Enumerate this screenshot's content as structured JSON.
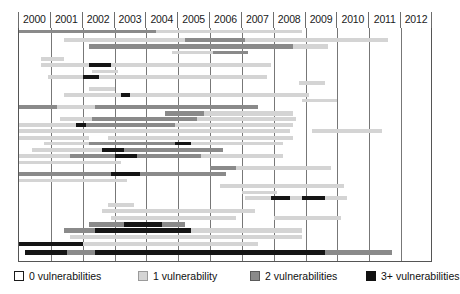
{
  "chart_data": {
    "type": "bar",
    "title": "",
    "subtitle": "",
    "xlabel": "",
    "ylabel": "",
    "orientation": "horizontal",
    "grid": true,
    "legend_position": "bottom",
    "xlim": [
      2000,
      2013
    ],
    "axis": {
      "tick_labels": [
        "2000",
        "2001",
        "2002",
        "2003",
        "2004",
        "2005",
        "2006",
        "2007",
        "2008",
        "2009",
        "2010",
        "2011",
        "2012"
      ],
      "year_start": 2000,
      "year_end": 2013,
      "column_count": 13
    },
    "categories": [
      "row-1",
      "row-2",
      "row-3",
      "row-4",
      "row-5",
      "row-6",
      "row-7",
      "row-8",
      "row-9",
      "row-10",
      "row-11",
      "row-12",
      "row-13",
      "row-14",
      "row-15",
      "row-16",
      "row-17",
      "row-18",
      "row-19",
      "row-20",
      "row-21",
      "row-22",
      "row-23",
      "row-24",
      "row-25",
      "row-26",
      "row-27",
      "row-28",
      "row-29",
      "row-30",
      "row-31",
      "row-32",
      "row-33",
      "row-34",
      "row-35",
      "row-36"
    ],
    "series": [
      {
        "name": "0 vulnerabilities",
        "level": 0,
        "color": "#ffffff"
      },
      {
        "name": "1 vulnerability",
        "level": 1,
        "color": "#d4d4d4"
      },
      {
        "name": "2 vulnerabilities",
        "level": 2,
        "color": "#8a8a8a"
      },
      {
        "name": "3+ vulnerabilities",
        "level": 3,
        "color": "#151515"
      }
    ],
    "rows": [
      {
        "y": 1.5,
        "h": 3.2,
        "segments": [
          {
            "x0": 2000.0,
            "x1": 2004.3,
            "level": 2
          },
          {
            "x0": 2004.3,
            "x1": 2008.9,
            "level": 1
          }
        ]
      },
      {
        "y": 10.0,
        "h": 4.0,
        "segments": [
          {
            "x0": 2001.4,
            "x1": 2005.2,
            "level": 1
          },
          {
            "x0": 2005.2,
            "x1": 2007.1,
            "level": 2
          },
          {
            "x0": 2007.1,
            "x1": 2011.6,
            "level": 1
          }
        ]
      },
      {
        "y": 16.0,
        "h": 4.5,
        "segments": [
          {
            "x0": 2002.2,
            "x1": 2008.6,
            "level": 2
          },
          {
            "x0": 2008.6,
            "x1": 2009.7,
            "level": 1
          }
        ]
      },
      {
        "y": 22.5,
        "h": 3.6,
        "segments": [
          {
            "x0": 2004.8,
            "x1": 2006.1,
            "level": 1
          },
          {
            "x0": 2006.1,
            "x1": 2007.2,
            "level": 2
          }
        ]
      },
      {
        "y": 29.0,
        "h": 3.8,
        "segments": [
          {
            "x0": 2000.7,
            "x1": 2001.4,
            "level": 1
          }
        ]
      },
      {
        "y": 35.0,
        "h": 4.4,
        "segments": [
          {
            "x0": 2000.7,
            "x1": 2002.2,
            "level": 1
          },
          {
            "x0": 2002.2,
            "x1": 2002.9,
            "level": 3
          },
          {
            "x0": 2002.9,
            "x1": 2007.9,
            "level": 1
          }
        ]
      },
      {
        "y": 41.5,
        "h": 3.4,
        "segments": [
          {
            "x0": 2002.3,
            "x1": 2003.1,
            "level": 1
          }
        ]
      },
      {
        "y": 47.0,
        "h": 4.2,
        "segments": [
          {
            "x0": 2000.9,
            "x1": 2002.0,
            "level": 1
          },
          {
            "x0": 2002.0,
            "x1": 2002.5,
            "level": 3
          },
          {
            "x0": 2002.5,
            "x1": 2007.8,
            "level": 1
          }
        ]
      },
      {
        "y": 53.0,
        "h": 3.6,
        "segments": [
          {
            "x0": 2008.8,
            "x1": 2009.6,
            "level": 1
          }
        ]
      },
      {
        "y": 58.5,
        "h": 4.6,
        "segments": [
          {
            "x0": 2002.2,
            "x1": 2003.0,
            "level": 1
          }
        ]
      },
      {
        "y": 65.0,
        "h": 3.8,
        "segments": [
          {
            "x0": 2001.4,
            "x1": 2003.2,
            "level": 1
          },
          {
            "x0": 2003.2,
            "x1": 2003.5,
            "level": 3
          },
          {
            "x0": 2003.5,
            "x1": 2009.1,
            "level": 1
          }
        ]
      },
      {
        "y": 71.0,
        "h": 3.4,
        "segments": [
          {
            "x0": 2008.9,
            "x1": 2010.0,
            "level": 1
          }
        ]
      },
      {
        "y": 76.5,
        "h": 4.4,
        "segments": [
          {
            "x0": 2000.0,
            "x1": 2001.2,
            "level": 2
          },
          {
            "x0": 2001.2,
            "x1": 2002.4,
            "level": 1
          },
          {
            "x0": 2002.4,
            "x1": 2007.5,
            "level": 2
          }
        ]
      },
      {
        "y": 83.0,
        "h": 4.6,
        "segments": [
          {
            "x0": 2004.6,
            "x1": 2005.8,
            "level": 2
          },
          {
            "x0": 2005.8,
            "x1": 2008.6,
            "level": 1
          }
        ]
      },
      {
        "y": 89.0,
        "h": 4.0,
        "segments": [
          {
            "x0": 2001.3,
            "x1": 2002.3,
            "level": 1
          },
          {
            "x0": 2002.3,
            "x1": 2005.6,
            "level": 2
          },
          {
            "x0": 2005.6,
            "x1": 2008.7,
            "level": 1
          }
        ]
      },
      {
        "y": 95.0,
        "h": 4.2,
        "segments": [
          {
            "x0": 2000.0,
            "x1": 2001.8,
            "level": 1
          },
          {
            "x0": 2001.8,
            "x1": 2002.1,
            "level": 3
          },
          {
            "x0": 2002.1,
            "x1": 2004.9,
            "level": 2
          },
          {
            "x0": 2004.9,
            "x1": 2008.6,
            "level": 1
          }
        ]
      },
      {
        "y": 101.0,
        "h": 4.4,
        "segments": [
          {
            "x0": 2000.0,
            "x1": 2001.5,
            "level": 1
          },
          {
            "x0": 2001.5,
            "x1": 2008.5,
            "level": 1
          },
          {
            "x0": 2009.2,
            "x1": 2011.4,
            "level": 1
          }
        ]
      },
      {
        "y": 107.5,
        "h": 4.0,
        "segments": [
          {
            "x0": 2000.0,
            "x1": 2002.2,
            "level": 1
          },
          {
            "x0": 2002.8,
            "x1": 2003.4,
            "level": 1
          },
          {
            "x0": 2003.4,
            "x1": 2008.6,
            "level": 1
          }
        ]
      },
      {
        "y": 113.5,
        "h": 3.6,
        "segments": [
          {
            "x0": 2000.8,
            "x1": 2002.2,
            "level": 1
          },
          {
            "x0": 2002.2,
            "x1": 2004.9,
            "level": 2
          },
          {
            "x0": 2004.9,
            "x1": 2005.4,
            "level": 3
          },
          {
            "x0": 2005.4,
            "x1": 2008.3,
            "level": 1
          }
        ]
      },
      {
        "y": 119.5,
        "h": 4.4,
        "segments": [
          {
            "x0": 2000.4,
            "x1": 2002.6,
            "level": 1
          },
          {
            "x0": 2002.6,
            "x1": 2003.3,
            "level": 3
          },
          {
            "x0": 2003.3,
            "x1": 2006.4,
            "level": 2
          }
        ]
      },
      {
        "y": 126.0,
        "h": 4.2,
        "segments": [
          {
            "x0": 2000.0,
            "x1": 2001.6,
            "level": 1
          },
          {
            "x0": 2001.6,
            "x1": 2003.0,
            "level": 2
          },
          {
            "x0": 2003.0,
            "x1": 2003.7,
            "level": 3
          },
          {
            "x0": 2003.7,
            "x1": 2005.7,
            "level": 2
          },
          {
            "x0": 2005.7,
            "x1": 2008.3,
            "level": 1
          }
        ]
      },
      {
        "y": 132.5,
        "h": 3.8,
        "segments": [
          {
            "x0": 2000.0,
            "x1": 2002.3,
            "level": 1
          },
          {
            "x0": 2002.3,
            "x1": 2003.2,
            "level": 1
          }
        ]
      },
      {
        "y": 138.0,
        "h": 4.0,
        "segments": [
          {
            "x0": 2006.0,
            "x1": 2006.8,
            "level": 2
          },
          {
            "x0": 2006.8,
            "x1": 2009.8,
            "level": 1
          }
        ]
      },
      {
        "y": 144.0,
        "h": 4.4,
        "segments": [
          {
            "x0": 2000.0,
            "x1": 2002.9,
            "level": 2
          },
          {
            "x0": 2002.9,
            "x1": 2003.8,
            "level": 3
          },
          {
            "x0": 2003.8,
            "x1": 2006.5,
            "level": 2
          }
        ]
      },
      {
        "y": 150.5,
        "h": 3.6,
        "segments": [
          {
            "x0": 2000.0,
            "x1": 2002.9,
            "level": 1
          },
          {
            "x0": 2002.9,
            "x1": 2003.4,
            "level": 1
          }
        ]
      },
      {
        "y": 156.0,
        "h": 4.2,
        "segments": [
          {
            "x0": 2006.3,
            "x1": 2007.5,
            "level": 1
          },
          {
            "x0": 2007.5,
            "x1": 2010.2,
            "level": 1
          }
        ]
      },
      {
        "y": 162.5,
        "h": 3.8,
        "segments": [
          {
            "x0": 2007.0,
            "x1": 2008.1,
            "level": 1
          }
        ]
      },
      {
        "y": 168.0,
        "h": 4.0,
        "segments": [
          {
            "x0": 2007.1,
            "x1": 2007.9,
            "level": 1
          },
          {
            "x0": 2007.9,
            "x1": 2008.5,
            "level": 3
          },
          {
            "x0": 2008.5,
            "x1": 2008.9,
            "level": 1
          },
          {
            "x0": 2008.9,
            "x1": 2009.6,
            "level": 3
          },
          {
            "x0": 2009.6,
            "x1": 2010.3,
            "level": 1
          }
        ]
      },
      {
        "y": 175.0,
        "h": 3.6,
        "segments": [
          {
            "x0": 2002.8,
            "x1": 2003.6,
            "level": 1
          }
        ]
      },
      {
        "y": 181.0,
        "h": 4.0,
        "segments": [
          {
            "x0": 2002.6,
            "x1": 2007.4,
            "level": 1
          }
        ]
      },
      {
        "y": 187.5,
        "h": 4.2,
        "segments": [
          {
            "x0": 2002.9,
            "x1": 2006.8,
            "level": 1
          },
          {
            "x0": 2008.0,
            "x1": 2010.1,
            "level": 1
          }
        ]
      },
      {
        "y": 193.5,
        "h": 5.0,
        "segments": [
          {
            "x0": 2002.2,
            "x1": 2003.3,
            "level": 2
          },
          {
            "x0": 2003.3,
            "x1": 2004.5,
            "level": 3
          },
          {
            "x0": 2004.5,
            "x1": 2005.2,
            "level": 2
          }
        ]
      },
      {
        "y": 200.0,
        "h": 4.6,
        "segments": [
          {
            "x0": 2001.4,
            "x1": 2002.4,
            "level": 2
          },
          {
            "x0": 2002.4,
            "x1": 2005.4,
            "level": 3
          },
          {
            "x0": 2005.4,
            "x1": 2008.9,
            "level": 1
          }
        ]
      },
      {
        "y": 207.0,
        "h": 4.0,
        "segments": [
          {
            "x0": 2001.6,
            "x1": 2004.6,
            "level": 1
          },
          {
            "x0": 2004.6,
            "x1": 2008.9,
            "level": 1
          }
        ]
      },
      {
        "y": 214.0,
        "h": 4.4,
        "segments": [
          {
            "x0": 2000.0,
            "x1": 2002.0,
            "level": 3
          },
          {
            "x0": 2002.0,
            "x1": 2004.2,
            "level": 1
          },
          {
            "x0": 2004.2,
            "x1": 2007.5,
            "level": 1
          }
        ]
      },
      {
        "y": 221.5,
        "h": 5.2,
        "segments": [
          {
            "x0": 2000.2,
            "x1": 2001.5,
            "level": 3
          },
          {
            "x0": 2001.5,
            "x1": 2002.4,
            "level": 2
          },
          {
            "x0": 2002.4,
            "x1": 2009.6,
            "level": 3
          },
          {
            "x0": 2009.6,
            "x1": 2011.7,
            "level": 2
          }
        ]
      }
    ]
  },
  "legend": {
    "items": [
      {
        "label": "0 vulnerabilities",
        "level": 0,
        "color": "#ffffff",
        "x": 0
      },
      {
        "label": "1 vulnerability",
        "level": 1,
        "color": "#d4d4d4",
        "x": 124
      },
      {
        "label": "2 vulnerabilities",
        "level": 2,
        "color": "#8a8a8a",
        "x": 236
      },
      {
        "label": "3+ vulnerabilities",
        "level": 3,
        "color": "#151515",
        "x": 352
      }
    ]
  },
  "colors": {
    "level0": "#ffffff",
    "level1": "#d4d4d4",
    "level2": "#8a8a8a",
    "level3": "#151515",
    "grid": "#777777",
    "axis": "#555555",
    "text": "#101010"
  }
}
